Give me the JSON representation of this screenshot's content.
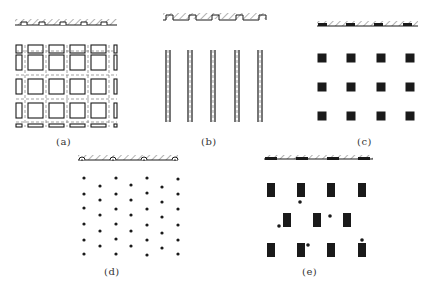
{
  "figure": {
    "colors": {
      "ink": "#1a1a1a",
      "dash": "#7a7a7a",
      "background": "#ffffff"
    },
    "panels": [
      {
        "id": "a",
        "caption": "(a)",
        "caption_pos": [
          56,
          136
        ],
        "description": "Grid of square cells with dashed centerlines; strip with round-topped notches",
        "strip": {
          "x": 15,
          "y": 22,
          "w": 102,
          "h": 6,
          "notch_xs": [
            24,
            42,
            63,
            84,
            104
          ],
          "notch_type": "square-arch"
        },
        "grid": {
          "col_xs": [
            28,
            49,
            70,
            91
          ],
          "row_ys": [
            55,
            79,
            103
          ],
          "cell": 15,
          "x0": 16,
          "x1": 117,
          "y0": 45,
          "y1": 127
        }
      },
      {
        "id": "b",
        "caption": "(b)",
        "caption_pos": [
          201,
          136
        ],
        "description": "Five vertical double-line strips with dashed centerlines; strip with rectangular notches",
        "strip": {
          "x": 163,
          "y": 15,
          "w": 103,
          "h": 6,
          "notch_xs": [
            166,
            189,
            212,
            236,
            259
          ],
          "notch_w": 7
        },
        "pillars": {
          "xs": [
            168,
            190,
            213,
            237,
            260
          ],
          "y0": 50,
          "y1": 122,
          "gap": 4
        }
      },
      {
        "id": "c",
        "caption": "(c)",
        "caption_pos": [
          357,
          136
        ],
        "description": "Regular 4x3 grid of square blocks; strip with embedded dark pads",
        "strip": {
          "x": 317,
          "y": 24,
          "w": 101,
          "h": 5,
          "pad_xs": [
            318,
            346,
            374,
            403
          ],
          "pad_w": 9
        },
        "blocks": {
          "xs": [
            322,
            351,
            381,
            410
          ],
          "ys": [
            58,
            87,
            116
          ],
          "size": 9
        }
      },
      {
        "id": "d",
        "caption": "(d)",
        "caption_pos": [
          104,
          266
        ],
        "description": "Staggered array of small dots; strip with small circular bumps",
        "strip": {
          "x": 78,
          "y": 158,
          "w": 100,
          "h": 5,
          "bump_xs": [
            82,
            113,
            144,
            175
          ]
        },
        "dots": {
          "columns": [
            {
              "x": 84,
              "ys": [
                178,
                194,
                208,
                224,
                240,
                254
              ]
            },
            {
              "x": 100,
              "ys": [
                186,
                200,
                215,
                231,
                246
              ]
            },
            {
              "x": 116,
              "ys": [
                178,
                194,
                209,
                224,
                239,
                254
              ]
            },
            {
              "x": 131,
              "ys": [
                185,
                200,
                215,
                231,
                246
              ]
            },
            {
              "x": 147,
              "ys": [
                178,
                193,
                209,
                225,
                240,
                255
              ]
            },
            {
              "x": 162,
              "ys": [
                187,
                202,
                217,
                233,
                248
              ]
            },
            {
              "x": 178,
              "ys": [
                179,
                194,
                209,
                225,
                240,
                254
              ]
            }
          ],
          "r": 1.6
        }
      },
      {
        "id": "e",
        "caption": "(e)",
        "caption_pos": [
          302,
          266
        ],
        "description": "Staggered rectangular blocks with scattered dots; strip with embedded dark pads",
        "strip": {
          "x": 264,
          "y": 158,
          "w": 109,
          "h": 4,
          "pad_xs": [
            265,
            296,
            327,
            358
          ],
          "pad_w": 12
        },
        "blocks": {
          "w": 8,
          "h": 14,
          "items": [
            [
              267,
              183
            ],
            [
              297,
              183
            ],
            [
              327,
              183
            ],
            [
              358,
              183
            ],
            [
              283,
              213
            ],
            [
              313,
              213
            ],
            [
              343,
              213
            ],
            [
              267,
              243
            ],
            [
              297,
              243
            ],
            [
              327,
              243
            ],
            [
              358,
              243
            ]
          ]
        },
        "dots": [
          [
            300,
            202
          ],
          [
            279,
            226
          ],
          [
            330,
            216
          ],
          [
            308,
            245
          ],
          [
            362,
            240
          ]
        ],
        "dot_r": 1.8
      }
    ]
  }
}
